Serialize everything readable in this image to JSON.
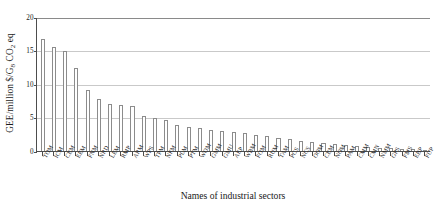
{
  "chart_data": {
    "type": "bar",
    "title": "",
    "xlabel": "Names of industrial sectors",
    "ylabel": "GEE/million $/G8 CO2 eq",
    "ylabel_parts": {
      "pre": "GEE/million $/G",
      "sub1": "8",
      "mid": " CO",
      "sub2": "2",
      "post": " eq"
    },
    "ylim": [
      0,
      20
    ],
    "yticks": [
      0,
      5,
      10,
      15,
      20
    ],
    "ytick_labels": [
      "0",
      "5",
      "10",
      "15",
      "20"
    ],
    "grid": true,
    "legend": "none",
    "bar_fill_color": "#ffffff",
    "bar_edge_color": "#8c8c8c",
    "gridline_color": "#c9c9c9",
    "axis_color": "#4d4d4d",
    "categories": [
      "TOM",
      "ICM",
      "CEM",
      "EEM",
      "FNM",
      "NRD",
      "LEM",
      "RMP",
      "ARM",
      "WPS",
      "TPM",
      "NFM",
      "PLM",
      "PTM",
      "WOM",
      "GMM",
      "GMU",
      "AEP",
      "WBM",
      "FOM",
      "RUM",
      "TAM",
      "PCS",
      "NCS",
      "OOM",
      "CEM",
      "NOM",
      "PAM",
      "CMM",
      "CMN",
      "NMM",
      "GPS",
      "FMS",
      "EBP",
      "FUP"
    ],
    "values": [
      16.6,
      15.5,
      14.8,
      12.3,
      9.1,
      7.7,
      6.9,
      6.85,
      6.6,
      5.2,
      4.85,
      4.5,
      3.85,
      3.55,
      3.35,
      3.05,
      2.9,
      2.75,
      2.55,
      2.3,
      2.1,
      1.9,
      1.7,
      1.45,
      1.3,
      1.1,
      0.95,
      0.8,
      0.65,
      0.55,
      0.45,
      0.35,
      0.28,
      0.2,
      0.12
    ],
    "tick_labels_rotated": true,
    "tick_label_rotation_deg": -60,
    "bar_count": 35
  }
}
